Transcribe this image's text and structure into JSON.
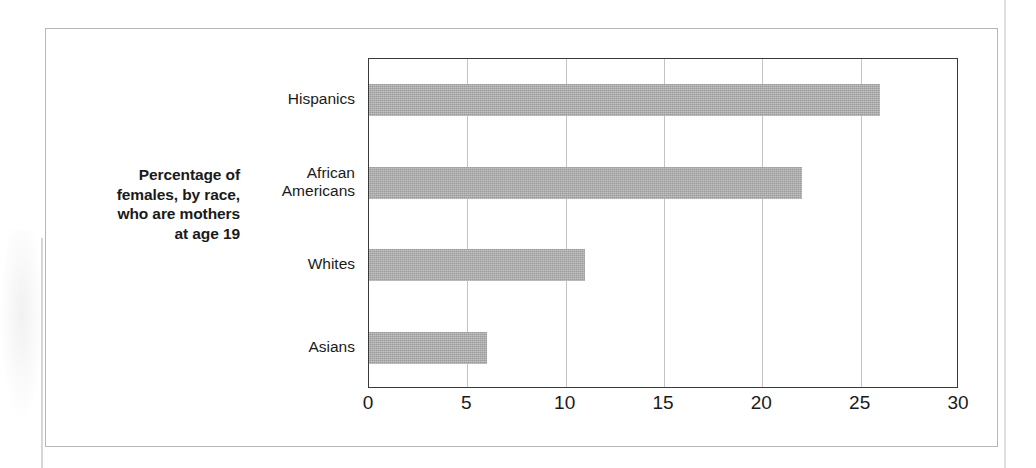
{
  "figure": {
    "caption_lines": [
      "Percentage of",
      "females, by race,",
      "who are mothers",
      "at age 19"
    ],
    "frame_color": "#b6b6b6",
    "bar_color": "#ababab",
    "axis_color": "#3a3a3a",
    "gridline_color": "#c3c3c3"
  },
  "chart_data": {
    "type": "bar",
    "orientation": "horizontal",
    "categories": [
      "Hispanics",
      "African Americans",
      "Whites",
      "Asians"
    ],
    "values": [
      26,
      22,
      11,
      6
    ],
    "xlabel": "",
    "ylabel": "",
    "xlim": [
      0,
      30
    ],
    "xticks": [
      0,
      5,
      10,
      15,
      20,
      25,
      30
    ],
    "xtick_labels": [
      "0",
      "5",
      "10",
      "15",
      "20",
      "25",
      "30"
    ],
    "grid": "vertical",
    "legend": "none",
    "units": "percent"
  }
}
